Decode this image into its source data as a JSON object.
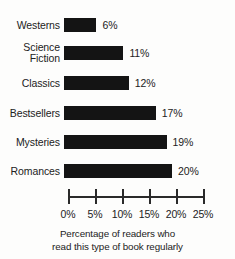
{
  "chart_data": {
    "type": "bar",
    "orientation": "horizontal",
    "title": "",
    "subtitle": "",
    "caption_line1": "Percentage of readers who",
    "caption_line2": "read this type of book regularly",
    "xlabel": "",
    "ylabel": "",
    "xlim": [
      0,
      25
    ],
    "grid": false,
    "legend": false,
    "categories": [
      "Westerns",
      "Science\nFiction",
      "Classics",
      "Bestsellers",
      "Mysteries",
      "Romances"
    ],
    "values": [
      6,
      11,
      12,
      17,
      19,
      20
    ],
    "value_labels": [
      "6%",
      "11%",
      "12%",
      "17%",
      "19%",
      "20%"
    ],
    "tick_values": [
      0,
      5,
      10,
      15,
      20,
      25
    ],
    "tick_labels": [
      "0%",
      "5%",
      "10%",
      "15%",
      "20%",
      "25%"
    ],
    "bar_color": "#141414",
    "axis_color": "#2a2a2a",
    "text_color": "#222222",
    "background_color": "#fdfdfc",
    "bars": [
      {
        "category": "Westerns",
        "label": "Westerns",
        "value": 6,
        "value_label": "6%"
      },
      {
        "category": "Science Fiction",
        "label": "Science\nFiction",
        "value": 11,
        "value_label": "11%"
      },
      {
        "category": "Classics",
        "label": "Classics",
        "value": 12,
        "value_label": "12%"
      },
      {
        "category": "Bestsellers",
        "label": "Bestsellers",
        "value": 17,
        "value_label": "17%"
      },
      {
        "category": "Mysteries",
        "label": "Mysteries",
        "value": 19,
        "value_label": "19%"
      },
      {
        "category": "Romances",
        "label": "Romances",
        "value": 20,
        "value_label": "20%"
      }
    ]
  }
}
